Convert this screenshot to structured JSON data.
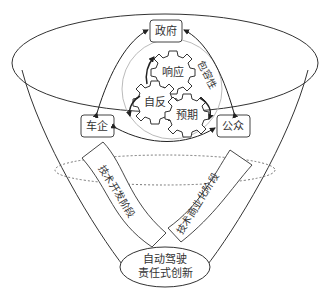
{
  "diagram": {
    "type": "funnel-model",
    "actors": {
      "government": "政府",
      "car_companies": "车企",
      "public": "公众"
    },
    "gears": {
      "respond": "响应",
      "reflect": "自反",
      "anticipate": "预期"
    },
    "inclusiveness_label": "包容性",
    "stages": {
      "tech_development": "技术开发阶段",
      "tech_commercialization": "技术商业化阶段"
    },
    "bottom": {
      "line1": "自动驾驶",
      "line2": "责任式创新"
    },
    "colors": {
      "stroke": "#333333",
      "dashed_circle": "#bbbbbb",
      "background": "#ffffff"
    }
  }
}
